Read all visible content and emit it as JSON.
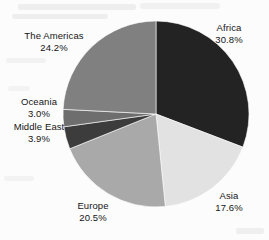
{
  "figure": {
    "background_color": "#fcfcfc",
    "label_color": "#151515"
  },
  "chart_data": {
    "type": "pie",
    "title": "",
    "subtitle": "",
    "xlabel": "",
    "ylabel": "",
    "legend_position": "none",
    "grid": false,
    "label_format": "name and percentage, outside slices",
    "start_angle_deg": 0,
    "direction": "clockwise",
    "categories": [
      "Africa",
      "Asia",
      "Europe",
      "Middle East",
      "Oceania",
      "The Americas"
    ],
    "values": [
      30.8,
      17.6,
      20.5,
      3.9,
      3.0,
      24.2
    ],
    "value_unit": "%",
    "colors": [
      "#232323",
      "#e2e2e2",
      "#a9a9a9",
      "#3c3c3c",
      "#6e6e6e",
      "#808080"
    ],
    "slices": [
      {
        "name": "Africa",
        "percent_label": "30.8%",
        "value": 30.8,
        "color": "#232323"
      },
      {
        "name": "Asia",
        "percent_label": "17.6%",
        "value": 17.6,
        "color": "#e2e2e2"
      },
      {
        "name": "Europe",
        "percent_label": "20.5%",
        "value": 20.5,
        "color": "#a9a9a9"
      },
      {
        "name": "Middle East",
        "percent_label": "3.9%",
        "value": 3.9,
        "color": "#3c3c3c"
      },
      {
        "name": "Oceania",
        "percent_label": "3.0%",
        "value": 3.0,
        "color": "#6e6e6e"
      },
      {
        "name": "The Americas",
        "percent_label": "24.2%",
        "value": 24.2,
        "color": "#808080"
      }
    ]
  }
}
